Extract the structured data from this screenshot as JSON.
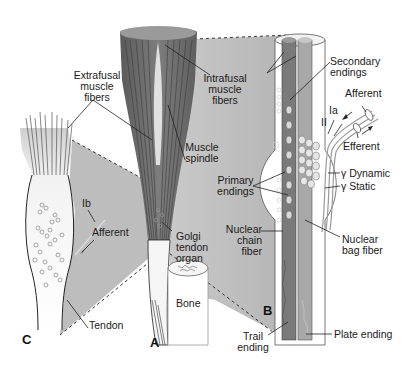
{
  "figure": {
    "colors": {
      "background": "#ffffff",
      "shadow_region": "#bdbdbd",
      "muscle_dark": "#6e6e6e",
      "intrafusal_dark": "#7a7a7a",
      "intrafusal_light": "#a8a8a8",
      "tendon_light": "#efefef",
      "line": "#1a1a1a"
    },
    "panels": {
      "a": "A",
      "b": "B",
      "c": "C"
    },
    "labels": {
      "extrafusal_1": "Extrafusal",
      "extrafusal_2": "muscle",
      "extrafusal_3": "fibers",
      "intrafusal_1": "Intrafusal",
      "intrafusal_2": "muscle",
      "intrafusal_3": "fibers",
      "spindle_1": "Muscle",
      "spindle_2": "spindle",
      "secondary_1": "Secondary",
      "secondary_2": "endings",
      "afferent_top": "Afferent",
      "ia": "Ia",
      "ii": "II",
      "efferent": "Efferent",
      "gamma_dynamic": "γ Dynamic",
      "gamma_static": "γ Static",
      "primary_1": "Primary",
      "primary_2": "endings",
      "nuclear_chain_1": "Nuclear",
      "nuclear_chain_2": "chain",
      "nuclear_chain_3": "fiber",
      "nuclear_bag_1": "Nuclear",
      "nuclear_bag_2": "bag fiber",
      "ib": "Ib",
      "afferent_c": "Afferent",
      "golgi_1": "Golgi",
      "golgi_2": "tendon",
      "golgi_3": "organ",
      "bone": "Bone",
      "tendon": "Tendon",
      "trail_1": "Trail",
      "trail_2": "ending",
      "plate": "Plate ending"
    }
  }
}
